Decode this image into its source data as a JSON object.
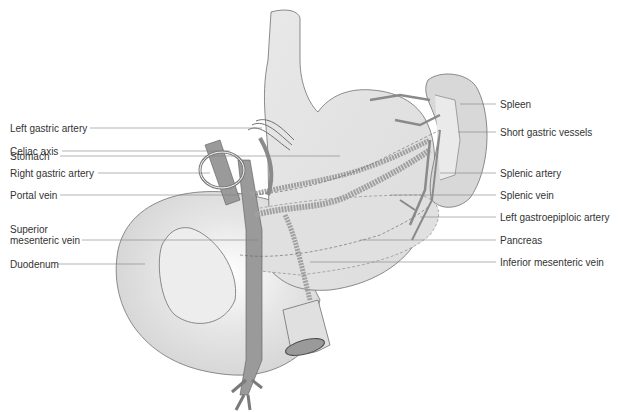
{
  "diagram": {
    "title_hidden": "Stomach, pancreas, spleen and duodenum with vasculature",
    "colors": {
      "organ_fill": "#e4e4e4",
      "organ_stroke": "#707070",
      "vessel_fill": "#9a9a9a",
      "vessel_stroke": "#5a5a5a",
      "leader_line": "#808080",
      "text": "#333333"
    },
    "left_labels": [
      {
        "id": "stomach",
        "text": "Stomach",
        "x": 10,
        "y": 156,
        "line_to": 340
      },
      {
        "id": "left-gastric-artery",
        "text": "Left gastric artery",
        "x": 10,
        "y": 128,
        "line_to": 260
      },
      {
        "id": "celiac-axis",
        "text": "Celiac axis",
        "x": 10,
        "y": 151,
        "line_to": 230
      },
      {
        "id": "right-gastric-artery",
        "text": "Right gastric artery",
        "x": 10,
        "y": 173,
        "line_to": 210
      },
      {
        "id": "portal-vein",
        "text": "Portal vein",
        "x": 10,
        "y": 195,
        "line_to": 240
      },
      {
        "id": "superior-mesenteric-vein",
        "text": "Superior\nmesenteric vein",
        "x": 10,
        "y": 235,
        "line_to": 258
      },
      {
        "id": "duodenum",
        "text": "Duodenum",
        "x": 10,
        "y": 264,
        "line_to": 145
      }
    ],
    "right_labels": [
      {
        "id": "spleen",
        "text": "Spleen",
        "x": 500,
        "y": 104
      },
      {
        "id": "short-gastric-vessels",
        "text": "Short gastric vessels",
        "x": 500,
        "y": 132
      },
      {
        "id": "splenic-artery",
        "text": "Splenic artery",
        "x": 500,
        "y": 173
      },
      {
        "id": "splenic-vein",
        "text": "Splenic vein",
        "x": 500,
        "y": 195
      },
      {
        "id": "left-gastroepiploic-artery",
        "text": "Left gastroepiploic artery",
        "x": 500,
        "y": 217
      },
      {
        "id": "pancreas",
        "text": "Pancreas",
        "x": 500,
        "y": 240
      },
      {
        "id": "inferior-mesenteric-vein",
        "text": "Inferior mesenteric vein",
        "x": 500,
        "y": 262
      }
    ]
  }
}
